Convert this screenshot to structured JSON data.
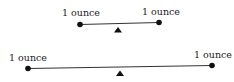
{
  "diagram": {
    "top_balance": {
      "left_label": "1 ounce",
      "right_label": "1 ounce"
    },
    "bottom_balance": {
      "left_label": "1 ounce",
      "right_label": "1 ounce"
    },
    "colors": {
      "line": "#333333",
      "weight": "#111111",
      "fulcrum": "#111111"
    }
  }
}
